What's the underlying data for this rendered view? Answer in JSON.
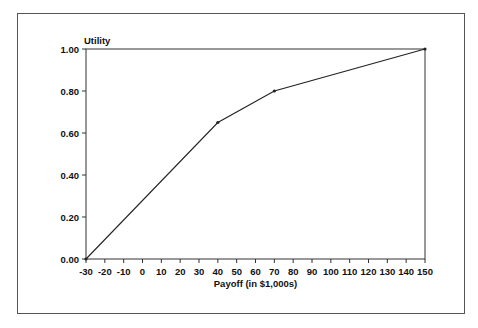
{
  "chart_data": {
    "type": "line",
    "title": "",
    "xlabel": "Payoff (in $1,000s)",
    "ylabel": "Utility",
    "x": [
      -30,
      40,
      70,
      150
    ],
    "series": [
      {
        "name": "Utility",
        "values": [
          0.0,
          0.65,
          0.8,
          1.0
        ]
      }
    ],
    "xlim": [
      -30,
      150
    ],
    "ylim": [
      0,
      1.0
    ],
    "xticks": [
      -30,
      -20,
      -10,
      0,
      10,
      20,
      30,
      40,
      50,
      60,
      70,
      80,
      90,
      100,
      110,
      120,
      130,
      140,
      150
    ],
    "yticks": [
      "0.00",
      "0.20",
      "0.40",
      "0.60",
      "0.80",
      "1.00"
    ],
    "grid": false,
    "legend": null,
    "colors": {
      "line": "#222222",
      "axis": "#333333",
      "frame": "#555555"
    }
  }
}
